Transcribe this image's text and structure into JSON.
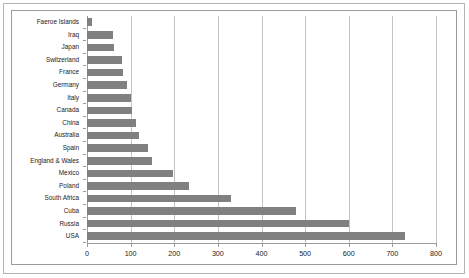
{
  "chart_data": {
    "type": "bar",
    "orientation": "horizontal",
    "title": "",
    "subtitle": "",
    "xlabel": "",
    "ylabel": "",
    "xlim": [
      0,
      800
    ],
    "xticks": [
      0,
      100,
      200,
      300,
      400,
      500,
      600,
      700,
      800
    ],
    "xtick_labels": [
      "0",
      "100",
      "200",
      "300",
      "400",
      "500",
      "600",
      "700",
      "800"
    ],
    "grid": true,
    "grid_axis": "x",
    "legend": false,
    "legend_position": "none",
    "bar_color": "#808080",
    "gridline_color": "#c3c3c3",
    "axis_color": "#9a9a9a",
    "frame_color": "#9a9a9a",
    "outer_border_color": "#b4b4b4",
    "background_color": "#ffffff",
    "categories": [
      "Faeroe Islands",
      "Iraq",
      "Japan",
      "Switzerland",
      "France",
      "Germany",
      "Italy",
      "Canada",
      "China",
      "Australia",
      "Spain",
      "England & Wales",
      "Mexico",
      "Poland",
      "South Africa",
      "Cuba",
      "Russia",
      "USA"
    ],
    "values": [
      12,
      60,
      62,
      80,
      82,
      92,
      100,
      103,
      112,
      120,
      140,
      148,
      197,
      234,
      330,
      480,
      600,
      730
    ]
  }
}
